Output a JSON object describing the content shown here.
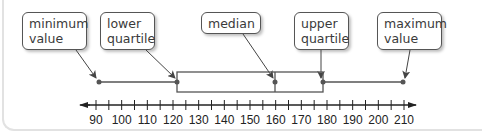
{
  "diagram": {
    "title": "",
    "type": "box-and-whisker plot",
    "callouts": {
      "minimum": "minimum\nvalue",
      "lower_quartile": "lower\nquartile",
      "median": "median",
      "upper_quartile": "upper\nquartile",
      "maximum": "maximum\nvalue"
    },
    "number_line": {
      "min": 90,
      "max": 210,
      "major_step": 10,
      "minor_step": 5,
      "labels": [
        "90",
        "100",
        "110",
        "120",
        "130",
        "140",
        "150",
        "160",
        "170",
        "180",
        "190",
        "200",
        "210"
      ]
    },
    "five_number_summary": {
      "minimum": 91,
      "lower_quartile": 122,
      "median": 160,
      "upper_quartile": 178,
      "maximum": 210
    },
    "colors": {
      "line": "#555555",
      "axis": "#222222",
      "point": "#555555",
      "frame": "#e2e2e2"
    }
  }
}
